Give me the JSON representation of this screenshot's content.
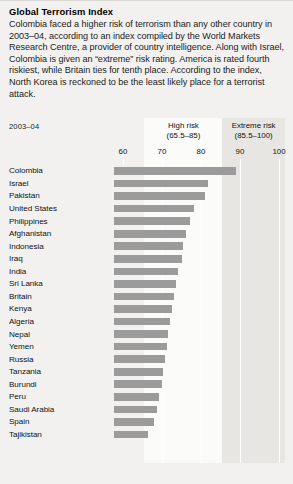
{
  "title": "Global Terrorism Index",
  "blurb": "Colombia faced a higher risk of terrorism than any other country in 2003–04, according to an index compiled by the World Markets Research Centre, a provider of country intelligence. Along with Israel, Colombia is given an “extreme” risk rating. America is rated fourth riskiest, while Britain ties for tenth place. According to the index, North Korea is reckoned to be the least likely place for a terrorist attack.",
  "period": "2003–04",
  "source": "",
  "colors": {
    "bar": "#9b9b9b",
    "page_background": "#f2f1ef",
    "high_risk_band": "#fbfbfa",
    "extreme_risk_band": "#e7e6e3",
    "gridline": "#ffffff"
  },
  "bands": [
    {
      "name": "high-risk",
      "label_line1": "High risk",
      "label_line2": "(65.5–85)",
      "from": 65.5,
      "to": 85
    },
    {
      "name": "extreme-risk",
      "label_line1": "Extreme risk",
      "label_line2": "(85.5–100)",
      "from": 85.5,
      "to": 100
    }
  ],
  "chart_data": {
    "type": "bar",
    "orientation": "horizontal",
    "title": "Global Terrorism Index",
    "subtitle": "2003–04",
    "xlabel": "",
    "ylabel": "",
    "xlim": [
      58,
      102
    ],
    "ticks": [
      60,
      70,
      80,
      90,
      100
    ],
    "tick_labels": [
      "60",
      "70",
      "80",
      "90",
      "100"
    ],
    "grid": true,
    "legend": false,
    "categories": [
      "Colombia",
      "Israel",
      "Pakistan",
      "United States",
      "Philippines",
      "Afghanistan",
      "Indonesia",
      "Iraq",
      "India",
      "Sri Lanka",
      "Britain",
      "Kenya",
      "Algeria",
      "Nepal",
      "Yemen",
      "Russia",
      "Tanzania",
      "Burundi",
      "Peru",
      "Saudi Arabia",
      "Spain",
      "Tajikistan"
    ],
    "values": [
      88.9,
      81.8,
      80.9,
      78.1,
      77.3,
      76.2,
      75.4,
      75.1,
      74.0,
      73.6,
      73.1,
      72.6,
      72.1,
      71.6,
      71.2,
      70.8,
      70.3,
      69.9,
      69.3,
      68.6,
      67.9,
      66.5
    ]
  }
}
